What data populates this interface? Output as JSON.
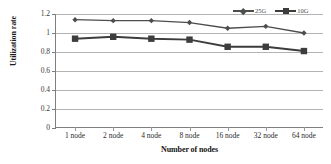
{
  "chart_data": {
    "type": "line",
    "title": "",
    "xlabel": "Number of nodes",
    "ylabel": "Utilization rate",
    "categories": [
      "1 node",
      "2 node",
      "4 node",
      "8 node",
      "16 node",
      "32 node",
      "64 node"
    ],
    "series": [
      {
        "name": "25G",
        "marker": "diamond",
        "color": "#4d4d4d",
        "values": [
          1.14,
          1.13,
          1.13,
          1.11,
          1.05,
          1.07,
          1.0
        ]
      },
      {
        "name": "10G",
        "marker": "square",
        "color": "#3d3d3d",
        "values": [
          0.94,
          0.96,
          0.94,
          0.93,
          0.855,
          0.855,
          0.81
        ]
      }
    ],
    "ylim": [
      0,
      1.2
    ],
    "y_ticks": [
      "0",
      "0.2",
      "0.4",
      "0.6",
      "0.8",
      "1",
      "1.2"
    ],
    "y_tick_values": [
      0,
      0.2,
      0.4,
      0.6,
      0.8,
      1.0,
      1.2
    ],
    "grid": true,
    "legend_position": "top-right"
  }
}
